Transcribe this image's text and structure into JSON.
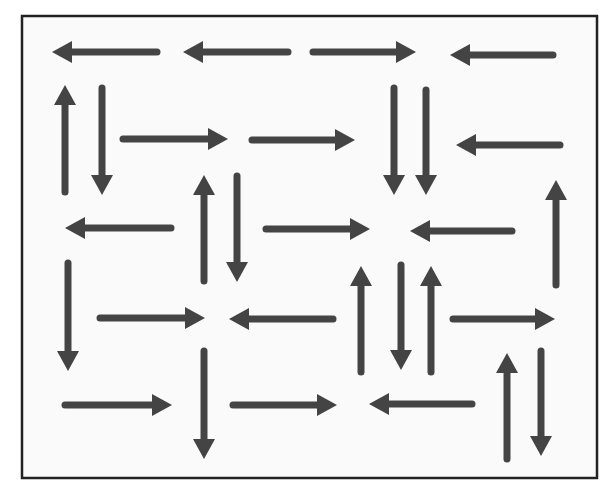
{
  "diagram": {
    "frame": {
      "x": 22,
      "y": 16,
      "width": 575,
      "height": 462,
      "stroke": "#222222",
      "stroke_width": 2.5,
      "fill": "#fafafa"
    },
    "arrow_color": "#444444",
    "shaft_width": 7,
    "head_length": 20,
    "head_width": 22,
    "arrows": [
      {
        "dir": "left",
        "x1": 157,
        "y1": 52,
        "x2": 52,
        "y2": 52
      },
      {
        "dir": "left",
        "x1": 288,
        "y1": 52,
        "x2": 183,
        "y2": 52
      },
      {
        "dir": "right",
        "x1": 313,
        "y1": 52,
        "x2": 416,
        "y2": 52
      },
      {
        "dir": "left",
        "x1": 553,
        "y1": 55,
        "x2": 450,
        "y2": 55
      },
      {
        "dir": "up",
        "x1": 65,
        "y1": 192,
        "x2": 65,
        "y2": 85
      },
      {
        "dir": "down",
        "x1": 102,
        "y1": 88,
        "x2": 102,
        "y2": 195
      },
      {
        "dir": "right",
        "x1": 123,
        "y1": 139,
        "x2": 228,
        "y2": 139
      },
      {
        "dir": "right",
        "x1": 252,
        "y1": 140,
        "x2": 355,
        "y2": 140
      },
      {
        "dir": "down",
        "x1": 394,
        "y1": 88,
        "x2": 394,
        "y2": 195
      },
      {
        "dir": "down",
        "x1": 426,
        "y1": 90,
        "x2": 426,
        "y2": 195
      },
      {
        "dir": "left",
        "x1": 560,
        "y1": 145,
        "x2": 456,
        "y2": 145
      },
      {
        "dir": "up",
        "x1": 204,
        "y1": 281,
        "x2": 204,
        "y2": 175
      },
      {
        "dir": "down",
        "x1": 237,
        "y1": 176,
        "x2": 237,
        "y2": 282
      },
      {
        "dir": "up",
        "x1": 556,
        "y1": 285,
        "x2": 556,
        "y2": 180
      },
      {
        "dir": "left",
        "x1": 171,
        "y1": 228,
        "x2": 65,
        "y2": 228
      },
      {
        "dir": "right",
        "x1": 266,
        "y1": 229,
        "x2": 370,
        "y2": 229
      },
      {
        "dir": "left",
        "x1": 512,
        "y1": 231,
        "x2": 410,
        "y2": 231
      },
      {
        "dir": "down",
        "x1": 68,
        "y1": 263,
        "x2": 68,
        "y2": 371
      },
      {
        "dir": "right",
        "x1": 100,
        "y1": 318,
        "x2": 205,
        "y2": 318
      },
      {
        "dir": "left",
        "x1": 333,
        "y1": 319,
        "x2": 229,
        "y2": 319
      },
      {
        "dir": "up",
        "x1": 361,
        "y1": 372,
        "x2": 361,
        "y2": 266
      },
      {
        "dir": "down",
        "x1": 401,
        "y1": 265,
        "x2": 401,
        "y2": 370
      },
      {
        "dir": "up",
        "x1": 431,
        "y1": 372,
        "x2": 431,
        "y2": 266
      },
      {
        "dir": "right",
        "x1": 453,
        "y1": 319,
        "x2": 555,
        "y2": 319
      },
      {
        "dir": "right",
        "x1": 65,
        "y1": 405,
        "x2": 172,
        "y2": 405
      },
      {
        "dir": "down",
        "x1": 204,
        "y1": 351,
        "x2": 204,
        "y2": 459
      },
      {
        "dir": "right",
        "x1": 233,
        "y1": 405,
        "x2": 337,
        "y2": 405
      },
      {
        "dir": "left",
        "x1": 472,
        "y1": 404,
        "x2": 369,
        "y2": 404
      },
      {
        "dir": "up",
        "x1": 507,
        "y1": 459,
        "x2": 507,
        "y2": 353
      },
      {
        "dir": "down",
        "x1": 541,
        "y1": 351,
        "x2": 541,
        "y2": 456
      }
    ]
  }
}
